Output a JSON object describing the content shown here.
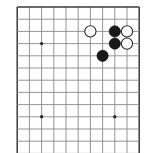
{
  "figure": {
    "kind": "go-board-diagram",
    "board_size": 19,
    "visible_columns": 11,
    "visible_rows": 12,
    "colors": {
      "background": "#ffffff",
      "grid_inner": "#8a8a8a",
      "grid_edge": "#3b3b3b",
      "star_point": "#2a2a2a",
      "black_stone": "#1a1a1a",
      "white_stone": "#ffffff",
      "white_stone_outline": "#2b2b2b"
    }
  },
  "chart_data": {
    "type": "diagram",
    "geometry": {
      "origin_x": 17.2,
      "origin_y": 7.0,
      "spacing": 12.2,
      "cols": 11,
      "rows": 12,
      "stone_radius": 5.6,
      "star_radius": 1.7
    },
    "grid": {
      "edges": [
        "top",
        "left",
        "right"
      ],
      "note": "board continues past bottom edge of image"
    },
    "star_points": [
      {
        "col": 2,
        "row": 3,
        "x": 41.6,
        "y": 43.6
      },
      {
        "col": 2,
        "row": 9,
        "x": 41.6,
        "y": 116.8
      },
      {
        "col": 8,
        "row": 9,
        "x": 114.8,
        "y": 116.8
      }
    ],
    "stones": [
      {
        "color": "white",
        "col": 6,
        "row": 2,
        "x": 90.4,
        "y": 31.4
      },
      {
        "color": "black",
        "col": 8,
        "row": 2,
        "x": 114.8,
        "y": 31.4
      },
      {
        "color": "white",
        "col": 9,
        "row": 2,
        "x": 127.0,
        "y": 31.4
      },
      {
        "color": "black",
        "col": 8,
        "row": 3,
        "x": 114.8,
        "y": 43.6
      },
      {
        "color": "white",
        "col": 9,
        "row": 3,
        "x": 127.0,
        "y": 43.6
      },
      {
        "color": "black",
        "col": 7,
        "row": 4,
        "x": 102.6,
        "y": 55.8
      }
    ],
    "counts": {
      "black": 3,
      "white": 3,
      "total": 6
    }
  }
}
